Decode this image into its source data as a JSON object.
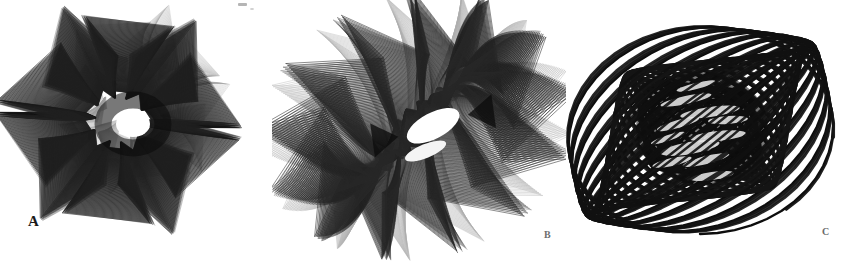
{
  "plate": {
    "width": 854,
    "height": 261,
    "background_color": "#ffffff",
    "ink_color": "#111111",
    "description": "Scanned plate of three harmonograph pendulum tracings labelled A, B and C"
  },
  "labels": {
    "a": "A",
    "b": "B",
    "c": "C"
  },
  "chart_data": {
    "type": "line",
    "xlabel": "",
    "ylabel": "",
    "grid": false,
    "legend_position": "none",
    "panels": [
      {
        "id": "A",
        "label": "A",
        "center": [
          118,
          120
        ],
        "bounds": [
          8,
          14,
          258,
          220
        ],
        "curve": "lateral harmonograph rosette",
        "stroke_color": "#141414",
        "stroke_width": 0.55,
        "turns": 122,
        "points_per_turn": 170,
        "center_void": {
          "cx": 133,
          "cy": 124,
          "rx": 17,
          "ry": 13
        },
        "params": {
          "x": "a1*exp(-d1*t)*sin(f1*t + p1) + a2*exp(-d2*t)*sin(f2*t + p2)",
          "y": "a3*exp(-d3*t)*sin(f3*t + p3) + a4*exp(-d4*t)*sin(f4*t + p4)",
          "a1": 96,
          "f1": 1.0,
          "p1": 0.0,
          "d1": 0.0016,
          "a2": 34,
          "f2": 15.0,
          "p2": 1.9,
          "d2": 0.0022,
          "a3": 92,
          "f3": 1.0,
          "p3": 1.5708,
          "d3": 0.0016,
          "a4": 34,
          "f4": 15.0,
          "p4": 0.35,
          "d4": 0.0022
        }
      },
      {
        "id": "B",
        "label": "B",
        "center": [
          417,
          126
        ],
        "bounds": [
          278,
          16,
          558,
          238
        ],
        "curve": "rotary harmonograph pinwheel",
        "stroke_color": "#1a1a1a",
        "stroke_width": 0.5,
        "turns": 132,
        "points_per_turn": 180,
        "center_void": {
          "cx": 433,
          "cy": 128,
          "rx": 29,
          "ry": 13,
          "rotation": -20
        },
        "params": {
          "x": "a1*exp(-d1*t)*sin(f1*t + p1) + a2*exp(-d2*t)*sin(f2*t + p2)",
          "y": "a3*exp(-d3*t)*sin(f3*t + p3) + a4*exp(-d4*t)*sin(f4*t + p4)",
          "a1": 126,
          "f1": 1.0,
          "p1": 0.0,
          "d1": 0.0018,
          "a2": 40,
          "f2": 14.0,
          "p2": 0.6,
          "d2": 0.0026,
          "a3": 100,
          "f3": 1.003,
          "p3": 1.5708,
          "d3": 0.0018,
          "a4": 40,
          "f4": 14.0,
          "p4": 2.25,
          "d4": 0.0026
        }
      },
      {
        "id": "C",
        "label": "C",
        "center": [
          700,
          130
        ],
        "bounds": [
          566,
          26,
          844,
          238
        ],
        "curve": "slow-precessing Lissajous scribble",
        "stroke_color": "#0d0d0d",
        "stroke_width": 2.4,
        "turns": 46,
        "points_per_turn": 220,
        "center_void": null,
        "params": {
          "x": "a1*exp(-d1*t)*sin(f1*t + p1)",
          "y": "a3*exp(-d3*t)*sin(f3*t + p3)",
          "a1": 134,
          "f1": 1.0,
          "p1": 0.0,
          "d1": 0.0042,
          "a3": 104,
          "f3": 1.031,
          "p3": 1.5708,
          "d3": 0.0042
        }
      }
    ]
  }
}
